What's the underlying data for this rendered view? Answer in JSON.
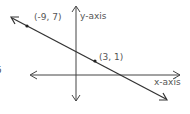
{
  "diagram": {
    "type": "coordinate-plane-line",
    "axes": {
      "x_label": "x-axis",
      "y_label": "y-axis"
    },
    "points": [
      {
        "label": "(-9, 7)",
        "x": -9,
        "y": 7
      },
      {
        "label": "(3, 1)",
        "x": 3,
        "y": 1
      }
    ],
    "line": {
      "through": [
        "(-9, 7)",
        "(3, 1)"
      ],
      "direction": "decreasing",
      "arrows": "both-ends"
    },
    "edge_fragment": "5"
  },
  "colors": {
    "line": "#333333",
    "axis": "#444444",
    "label": "#555555",
    "background": "#ffffff"
  }
}
